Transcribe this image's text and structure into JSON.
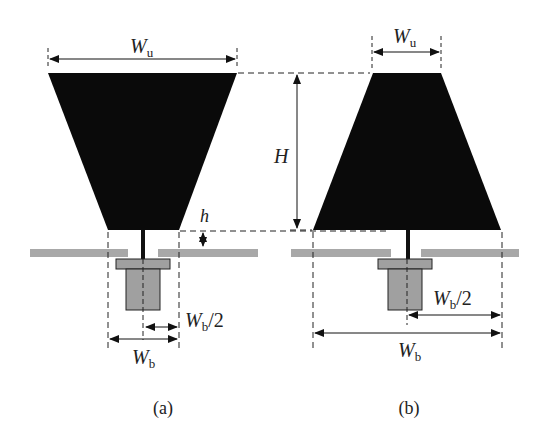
{
  "figure": {
    "panels": [
      {
        "id": "a",
        "caption": "(a)",
        "description": "Inverted trapezoid planar monopole above ground plane with coaxial feed",
        "labels": {
          "top_width": {
            "main": "W",
            "sub": "u"
          },
          "gap": "h",
          "half_base": {
            "main": "W",
            "sub": "b",
            "suffix": "/2"
          },
          "base_width": {
            "main": "W",
            "sub": "b"
          }
        }
      },
      {
        "id": "b",
        "caption": "(b)",
        "description": "Upright trapezoid planar monopole above ground plane with coaxial feed",
        "labels": {
          "top_width": {
            "main": "W",
            "sub": "u"
          },
          "height": "H",
          "half_base": {
            "main": "W",
            "sub": "b",
            "suffix": "/2"
          },
          "base_width": {
            "main": "W",
            "sub": "b"
          }
        }
      }
    ],
    "colors": {
      "patch": "#0a0a0a",
      "ground": "#a8a8a8",
      "connector": "#a0a0a0",
      "line": "#222222"
    }
  }
}
